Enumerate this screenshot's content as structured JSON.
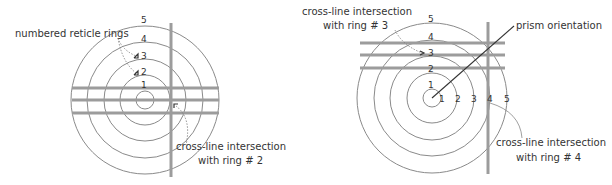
{
  "left_panel": {
    "ring_labels": [
      "1",
      "2",
      "3",
      "4",
      "5"
    ],
    "annotations": {
      "reticle_rings": "numbered reticle rings",
      "intersection_line1": "cross-line intersection",
      "intersection_line2": "with ring # 2"
    }
  },
  "right_panel": {
    "ring_labels_vertical": [
      "1",
      "2",
      "3",
      "4",
      "5"
    ],
    "ring_labels_horizontal": [
      "1",
      "2",
      "3",
      "4",
      "5"
    ],
    "annotations": {
      "top_intersection_line1": "cross-line intersection",
      "top_intersection_line2": "with ring # 3",
      "prism_orientation": "prism orientation",
      "bottom_intersection_line1": "cross-line intersection",
      "bottom_intersection_line2": "with ring # 4"
    }
  },
  "colors": {
    "ring_stroke": "#8a8a8a",
    "cross_line": "#9c9c9c",
    "text": "#333333"
  }
}
